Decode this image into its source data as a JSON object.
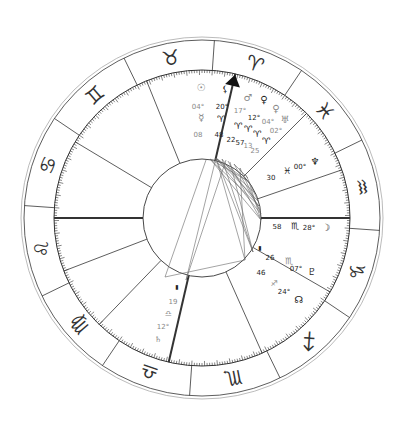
{
  "chart": {
    "center": [
      202,
      218
    ],
    "radii": {
      "outer": 181,
      "outer2": 178,
      "zodiac_inner": 148,
      "tick": 143,
      "inner": 59
    },
    "colors": {
      "line": "#333333",
      "light_line": "#888888",
      "aspect": "#666666",
      "glyph": "#333333",
      "deg_light": "#888888"
    },
    "sign_boundaries_deg": [
      56,
      86,
      116,
      146,
      176,
      206,
      236,
      266,
      296,
      326,
      356,
      26
    ],
    "signs": [
      {
        "name": "Aries",
        "glyph": "♈",
        "angle": 71
      },
      {
        "name": "Taurus",
        "glyph": "♉",
        "angle": 101
      },
      {
        "name": "Gemini",
        "glyph": "♊",
        "angle": 131
      },
      {
        "name": "Cancer",
        "glyph": "♋",
        "angle": 161
      },
      {
        "name": "Leo",
        "glyph": "♌",
        "angle": 191
      },
      {
        "name": "Virgo",
        "glyph": "♍",
        "angle": 221
      },
      {
        "name": "Libra",
        "glyph": "♎",
        "angle": 251
      },
      {
        "name": "Scorpio",
        "glyph": "♏",
        "angle": 281
      },
      {
        "name": "Sagittarius",
        "glyph": "♐",
        "angle": 311
      },
      {
        "name": "Capricorn",
        "glyph": "♑",
        "angle": 341
      },
      {
        "name": "Aquarius",
        "glyph": "♒",
        "angle": 11
      },
      {
        "name": "Pisces",
        "glyph": "♓",
        "angle": 41
      }
    ],
    "houses": [
      {
        "cusp": 0,
        "angle": 180,
        "bold": true,
        "label": "ASC"
      },
      {
        "cusp": 1,
        "angle": 201,
        "bold": false
      },
      {
        "cusp": 2,
        "angle": 226,
        "bold": false
      },
      {
        "cusp": 3,
        "angle": 257,
        "bold": true,
        "label": "IC"
      },
      {
        "cusp": 4,
        "angle": 294,
        "bold": false
      },
      {
        "cusp": 5,
        "angle": 330,
        "bold": false
      },
      {
        "cusp": 6,
        "angle": 0,
        "bold": true,
        "label": "DSC"
      },
      {
        "cusp": 7,
        "angle": 19,
        "bold": false
      },
      {
        "cusp": 8,
        "angle": 45,
        "bold": false
      },
      {
        "cusp": 9,
        "angle": 77,
        "bold": true,
        "label": "MC",
        "arrow": true
      },
      {
        "cusp": 10,
        "angle": 112,
        "bold": false
      },
      {
        "cusp": 11,
        "angle": 149,
        "bold": false
      }
    ],
    "labels": [
      {
        "text": "☉",
        "x": 201,
        "y": 91,
        "size": 10,
        "tone": "light"
      },
      {
        "text": "04°",
        "x": 198,
        "y": 109,
        "size": 7,
        "tone": "light"
      },
      {
        "text": "☿",
        "x": 201,
        "y": 121,
        "size": 10,
        "tone": "light"
      },
      {
        "text": "08",
        "x": 198,
        "y": 137,
        "size": 7,
        "tone": "light"
      },
      {
        "text": "⚸",
        "x": 225,
        "y": 92,
        "size": 9,
        "tone": "dark"
      },
      {
        "text": "20°",
        "x": 222,
        "y": 109,
        "size": 7,
        "tone": "dark"
      },
      {
        "text": "♈",
        "x": 221,
        "y": 122,
        "size": 9,
        "tone": "dark"
      },
      {
        "text": "48",
        "x": 219,
        "y": 137,
        "size": 7,
        "tone": "dark"
      },
      {
        "text": "♂",
        "x": 248,
        "y": 101,
        "size": 10,
        "tone": "light"
      },
      {
        "text": "♀",
        "x": 264,
        "y": 103,
        "size": 10,
        "tone": "dark"
      },
      {
        "text": "♀",
        "x": 276,
        "y": 112,
        "size": 10,
        "tone": "light"
      },
      {
        "text": "♅",
        "x": 285,
        "y": 123,
        "size": 10,
        "tone": "light"
      },
      {
        "text": "17°",
        "x": 240,
        "y": 113,
        "size": 7,
        "tone": "light"
      },
      {
        "text": "12°",
        "x": 254,
        "y": 120,
        "size": 7,
        "tone": "dark"
      },
      {
        "text": "04°",
        "x": 268,
        "y": 124,
        "size": 7,
        "tone": "light"
      },
      {
        "text": "02°",
        "x": 276,
        "y": 133,
        "size": 7,
        "tone": "light"
      },
      {
        "text": "♈",
        "x": 238,
        "y": 129,
        "size": 9,
        "tone": "dark"
      },
      {
        "text": "♈",
        "x": 248,
        "y": 132,
        "size": 9,
        "tone": "dark"
      },
      {
        "text": "♈",
        "x": 257,
        "y": 137,
        "size": 9,
        "tone": "dark"
      },
      {
        "text": "♈",
        "x": 266,
        "y": 144,
        "size": 9,
        "tone": "dark"
      },
      {
        "text": "22",
        "x": 231,
        "y": 142,
        "size": 7,
        "tone": "dark"
      },
      {
        "text": "57",
        "x": 240,
        "y": 145,
        "size": 7,
        "tone": "dark"
      },
      {
        "text": "13",
        "x": 248,
        "y": 148,
        "size": 7,
        "tone": "light"
      },
      {
        "text": "25",
        "x": 255,
        "y": 153,
        "size": 7,
        "tone": "light"
      },
      {
        "text": "♆",
        "x": 315,
        "y": 165,
        "size": 10,
        "tone": "dark"
      },
      {
        "text": "00°",
        "x": 300,
        "y": 169,
        "size": 7,
        "tone": "dark"
      },
      {
        "text": "♓",
        "x": 287,
        "y": 174,
        "size": 9,
        "tone": "dark"
      },
      {
        "text": "30",
        "x": 271,
        "y": 180,
        "size": 7,
        "tone": "dark"
      },
      {
        "text": "58",
        "x": 277,
        "y": 229,
        "size": 7,
        "tone": "dark"
      },
      {
        "text": "♏",
        "x": 295,
        "y": 229,
        "size": 9,
        "tone": "dark"
      },
      {
        "text": "28°",
        "x": 309,
        "y": 230,
        "size": 7,
        "tone": "dark"
      },
      {
        "text": "☽",
        "x": 326,
        "y": 231,
        "size": 10,
        "tone": "dark"
      },
      {
        "text": "▮",
        "x": 260,
        "y": 250,
        "size": 6,
        "tone": "dark"
      },
      {
        "text": "26",
        "x": 270,
        "y": 260,
        "size": 7,
        "tone": "dark"
      },
      {
        "text": "♏",
        "x": 289,
        "y": 264,
        "size": 9,
        "tone": "light"
      },
      {
        "text": "07°",
        "x": 296,
        "y": 271,
        "size": 7,
        "tone": "dark"
      },
      {
        "text": "♇",
        "x": 312,
        "y": 275,
        "size": 10,
        "tone": "dark"
      },
      {
        "text": "46",
        "x": 261,
        "y": 275,
        "size": 7,
        "tone": "dark"
      },
      {
        "text": "♐",
        "x": 274,
        "y": 286,
        "size": 8,
        "tone": "light"
      },
      {
        "text": "24°",
        "x": 284,
        "y": 294,
        "size": 7,
        "tone": "dark"
      },
      {
        "text": "☊",
        "x": 299,
        "y": 303,
        "size": 10,
        "tone": "dark"
      },
      {
        "text": "▮",
        "x": 177,
        "y": 289,
        "size": 6,
        "tone": "dark"
      },
      {
        "text": "19",
        "x": 173,
        "y": 304,
        "size": 7,
        "tone": "light"
      },
      {
        "text": "♎",
        "x": 168,
        "y": 316,
        "size": 8,
        "tone": "light"
      },
      {
        "text": "12°",
        "x": 163,
        "y": 329,
        "size": 7,
        "tone": "light"
      },
      {
        "text": "♄",
        "x": 158,
        "y": 342,
        "size": 8,
        "tone": "light"
      }
    ],
    "aspects": [
      [
        [
          206,
          160
        ],
        [
          165,
          277
        ]
      ],
      [
        [
          216,
          158
        ],
        [
          186,
          280
        ]
      ],
      [
        [
          216,
          158
        ],
        [
          249,
          182
        ]
      ],
      [
        [
          216,
          158
        ],
        [
          255,
          193
        ]
      ],
      [
        [
          216,
          158
        ],
        [
          258,
          201
        ]
      ],
      [
        [
          216,
          158
        ],
        [
          261,
          214
        ]
      ],
      [
        [
          216,
          158
        ],
        [
          253,
          252
        ]
      ],
      [
        [
          216,
          158
        ],
        [
          245,
          260
        ]
      ],
      [
        [
          210,
          159
        ],
        [
          246,
          180
        ]
      ],
      [
        [
          210,
          159
        ],
        [
          259,
          206
        ]
      ],
      [
        [
          210,
          159
        ],
        [
          261,
          220
        ]
      ],
      [
        [
          222,
          159
        ],
        [
          259,
          206
        ]
      ],
      [
        [
          222,
          159
        ],
        [
          253,
          252
        ]
      ],
      [
        [
          228,
          161
        ],
        [
          261,
          220
        ]
      ],
      [
        [
          234,
          164
        ],
        [
          260,
          210
        ]
      ],
      [
        [
          234,
          164
        ],
        [
          248,
          178
        ]
      ],
      [
        [
          240,
          168
        ],
        [
          261,
          214
        ]
      ],
      [
        [
          240,
          168
        ],
        [
          245,
          260
        ]
      ],
      [
        [
          246,
          175
        ],
        [
          258,
          201
        ]
      ],
      [
        [
          226,
          160
        ],
        [
          186,
          280
        ]
      ],
      [
        [
          165,
          277
        ],
        [
          245,
          260
        ]
      ],
      [
        [
          249,
          182
        ],
        [
          261,
          220
        ]
      ],
      [
        [
          230,
          162
        ],
        [
          253,
          252
        ]
      ]
    ]
  }
}
